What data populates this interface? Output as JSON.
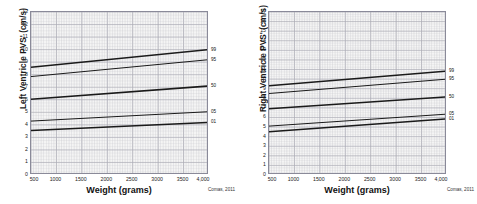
{
  "figure": {
    "citation": "Comas, 2011",
    "background_color": "#ffffff",
    "plot_background_color": "#f4f4f4",
    "grid_color": "#c9c9cf",
    "axis_color": "#8a8a99",
    "line_color": "#1a1a1a"
  },
  "chart_data": [
    {
      "type": "line",
      "title": "",
      "xlabel": "Weight (grams)",
      "ylabel": "Left Ventricle PVS' (cm/s)",
      "xlim": [
        500,
        4000
      ],
      "ylim": [
        0,
        13
      ],
      "grid": true,
      "legend_position": "right-of-axis",
      "xticks": [
        500,
        1000,
        1500,
        2000,
        2500,
        3000,
        3500,
        4000
      ],
      "xticklabels": [
        "500",
        "1000",
        "1500",
        "2000",
        "2500",
        "3000",
        "3500",
        "4,000"
      ],
      "yticks": [
        0,
        1,
        2,
        3,
        4,
        5,
        6,
        7,
        8,
        9,
        10,
        11,
        12,
        13
      ],
      "yticklabels": [
        "0",
        "1",
        "2",
        "3",
        "4",
        "5",
        "6",
        "7",
        "8",
        "9",
        "10",
        "11",
        "12",
        "13"
      ],
      "x": [
        500,
        4000
      ],
      "series": [
        {
          "name": "99",
          "label": "99",
          "values": [
            8.6,
            10.0
          ]
        },
        {
          "name": "95",
          "label": "95",
          "values": [
            7.85,
            9.2
          ]
        },
        {
          "name": "50",
          "label": "50",
          "values": [
            6.05,
            7.1
          ]
        },
        {
          "name": "05",
          "label": "05",
          "values": [
            4.3,
            5.05
          ]
        },
        {
          "name": "01",
          "label": "01",
          "values": [
            3.55,
            4.2
          ]
        }
      ],
      "citation": "Comas, 2011"
    },
    {
      "type": "line",
      "title": "",
      "xlabel": "Weight (grams)",
      "ylabel": "Right Ventricle PVS' (cm/s)",
      "xlim": [
        500,
        4000
      ],
      "ylim": [
        0,
        17
      ],
      "grid": true,
      "legend_position": "right-of-axis",
      "xticks": [
        500,
        1000,
        1500,
        2000,
        2500,
        3000,
        3500,
        4000
      ],
      "xticklabels": [
        "500",
        "1000",
        "1500",
        "2000",
        "2500",
        "3000",
        "3500",
        "4,000"
      ],
      "yticks": [
        0,
        1,
        2,
        3,
        4,
        5,
        6,
        7,
        8,
        9,
        10,
        11,
        12,
        13,
        14,
        15,
        16,
        17
      ],
      "yticklabels": [
        "0",
        "1",
        "2",
        "3",
        "4",
        "5",
        "6",
        "7",
        "8",
        "9",
        "10",
        "11",
        "12",
        "13",
        "14",
        "15",
        "16",
        "17"
      ],
      "x": [
        500,
        4000
      ],
      "series": [
        {
          "name": "99",
          "label": "99",
          "values": [
            9.3,
            10.85
          ]
        },
        {
          "name": "95",
          "label": "95",
          "values": [
            8.5,
            10.0
          ]
        },
        {
          "name": "50",
          "label": "50",
          "values": [
            6.9,
            8.15
          ]
        },
        {
          "name": "05",
          "label": "05",
          "values": [
            5.1,
            6.35
          ]
        },
        {
          "name": "01",
          "label": "01",
          "values": [
            4.5,
            5.85
          ]
        }
      ],
      "citation": "Comas, 2011"
    }
  ]
}
